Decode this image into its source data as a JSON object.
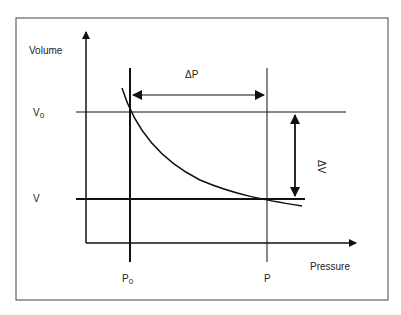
{
  "diagram": {
    "type": "pressure-volume",
    "y_axis_label": "Volume",
    "x_axis_label": "Pressure",
    "delta_p_label": "ΔP",
    "delta_v_label": "ΔV",
    "v0_label": "V",
    "v0_sub": "0",
    "v_label": "V",
    "p0_label": "P",
    "p0_sub": "0",
    "p_label": "P",
    "colors": {
      "line": "#111111",
      "frame": "#333333",
      "background": "#ffffff"
    }
  }
}
